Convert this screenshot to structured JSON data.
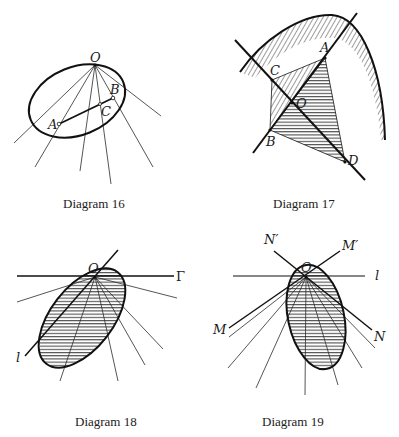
{
  "diagrams": [
    {
      "id": "16",
      "caption": "Diagram 16",
      "labels": {
        "O": "O",
        "A": "A",
        "B": "B",
        "C": "C"
      }
    },
    {
      "id": "17",
      "caption": "Diagram 17",
      "labels": {
        "A": "A",
        "B": "B",
        "C": "C",
        "D": "D",
        "O": "O"
      }
    },
    {
      "id": "18",
      "caption": "Diagram 18",
      "labels": {
        "O": "O",
        "Gamma": "Γ",
        "l": "l"
      }
    },
    {
      "id": "19",
      "caption": "Diagram 19",
      "labels": {
        "O": "O",
        "l": "l",
        "N_prime": "N′",
        "M_prime": "M′",
        "M": "M",
        "N": "N"
      }
    }
  ],
  "colors": {
    "ink": "#111111",
    "background": "#ffffff"
  }
}
